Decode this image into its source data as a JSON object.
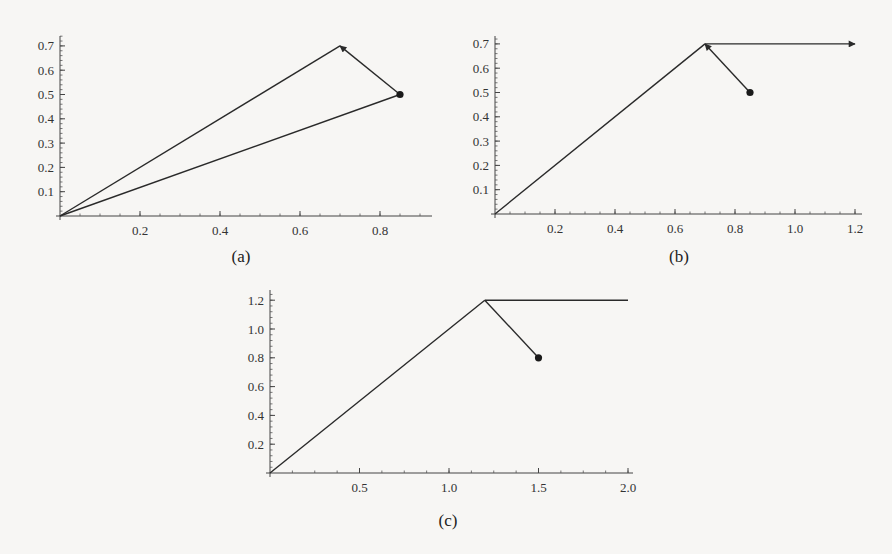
{
  "chart_data": [
    {
      "id": "a",
      "type": "line",
      "caption": "(a)",
      "xlim": [
        0,
        0.87
      ],
      "ylim": [
        0,
        0.72
      ],
      "xticks": [
        0.2,
        0.4,
        0.6,
        0.8
      ],
      "xtick_labels": [
        "0.2",
        "0.4",
        "0.6",
        "0.8"
      ],
      "yticks": [
        0.1,
        0.2,
        0.3,
        0.4,
        0.5,
        0.6,
        0.7
      ],
      "ytick_labels": [
        "0.1",
        "0.2",
        "0.3",
        "0.4",
        "0.5",
        "0.6",
        "0.7"
      ],
      "point": [
        0.85,
        0.5
      ],
      "segments": [
        {
          "from": [
            0,
            0
          ],
          "to": [
            0.85,
            0.5
          ],
          "arrow": false
        },
        {
          "from": [
            0.85,
            0.5
          ],
          "to": [
            0.7,
            0.7
          ],
          "arrow": true
        },
        {
          "from": [
            0.7,
            0.7
          ],
          "to": [
            0,
            0
          ],
          "arrow": false
        }
      ]
    },
    {
      "id": "b",
      "type": "line",
      "caption": "(b)",
      "xlim": [
        0,
        1.22
      ],
      "ylim": [
        0,
        0.72
      ],
      "xticks": [
        0.2,
        0.4,
        0.6,
        0.8,
        1.0,
        1.2
      ],
      "xtick_labels": [
        "0.2",
        "0.4",
        "0.6",
        "0.8",
        "1.0",
        "1.2"
      ],
      "yticks": [
        0.1,
        0.2,
        0.3,
        0.4,
        0.5,
        0.6,
        0.7
      ],
      "ytick_labels": [
        "0.1",
        "0.2",
        "0.3",
        "0.4",
        "0.5",
        "0.6",
        "0.7"
      ],
      "point": [
        0.85,
        0.5
      ],
      "segments": [
        {
          "from": [
            0,
            0
          ],
          "to": [
            0.7,
            0.7
          ],
          "arrow": false
        },
        {
          "from": [
            0.85,
            0.5
          ],
          "to": [
            0.7,
            0.7
          ],
          "arrow": true
        },
        {
          "from": [
            0.7,
            0.7
          ],
          "to": [
            1.2,
            0.7
          ],
          "arrow": true
        }
      ]
    },
    {
      "id": "c",
      "type": "line",
      "caption": "(c)",
      "xlim": [
        0,
        2.0
      ],
      "ylim": [
        0,
        1.25
      ],
      "xticks": [
        0.5,
        1.0,
        1.5,
        2.0
      ],
      "xtick_labels": [
        "0.5",
        "1.0",
        "1.5",
        "2.0"
      ],
      "yticks": [
        0.2,
        0.4,
        0.6,
        0.8,
        1.0,
        1.2
      ],
      "ytick_labels": [
        "0.2",
        "0.4",
        "0.6",
        "0.8",
        "1.0",
        "1.2"
      ],
      "point": [
        1.5,
        0.8
      ],
      "segments": [
        {
          "from": [
            0,
            0
          ],
          "to": [
            1.2,
            1.2
          ],
          "arrow": false
        },
        {
          "from": [
            1.5,
            0.8
          ],
          "to": [
            1.2,
            1.2
          ],
          "arrow": false
        },
        {
          "from": [
            1.2,
            1.2
          ],
          "to": [
            2.0,
            1.2
          ],
          "arrow": false
        }
      ]
    }
  ]
}
